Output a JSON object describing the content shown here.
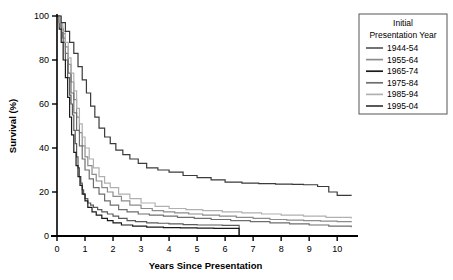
{
  "chart_data": {
    "type": "line",
    "title": "",
    "xlabel": "Years Since Presentation",
    "ylabel": "Survival (%)",
    "xlim": [
      0,
      10.6
    ],
    "ylim": [
      0,
      100
    ],
    "xticks": [
      "0",
      "1",
      "2",
      "3",
      "4",
      "5",
      "6",
      "7",
      "8",
      "9",
      "10"
    ],
    "xtick_values": [
      0,
      1,
      2,
      3,
      4,
      5,
      6,
      7,
      8,
      9,
      10
    ],
    "yticks": [
      "0",
      "20",
      "40",
      "60",
      "80",
      "100"
    ],
    "ytick_values": [
      0,
      20,
      40,
      60,
      80,
      100
    ],
    "grid": false,
    "step_style": "post",
    "legend": {
      "position": "top-right-outside",
      "title_line1": "Initial",
      "title_line2": "Presentation Year",
      "entries": [
        {
          "label": "1944-54",
          "color": "#5a5a5a"
        },
        {
          "label": "1955-64",
          "color": "#8c8c8c"
        },
        {
          "label": "1965-74",
          "color": "#1a1a1a"
        },
        {
          "label": "1975-84",
          "color": "#6e6e6e"
        },
        {
          "label": "1985-94",
          "color": "#b0b0b0"
        },
        {
          "label": "1995-04",
          "color": "#3a3a3a"
        }
      ]
    },
    "series": [
      {
        "name": "1944-54",
        "color": "#5a5a5a",
        "x": [
          0,
          0.08,
          0.15,
          0.22,
          0.3,
          0.38,
          0.45,
          0.5,
          0.55,
          0.6,
          0.65,
          0.7,
          0.75,
          0.8,
          0.85,
          0.9,
          0.95,
          1.0,
          1.1,
          1.2,
          1.3,
          1.45,
          1.6,
          1.8,
          2.0,
          2.2,
          2.5,
          2.8,
          3.2,
          3.6,
          4.0,
          4.5,
          5.0,
          5.5,
          5.9,
          6.4,
          6.5
        ],
        "y": [
          100,
          97,
          94,
          88,
          80,
          72,
          64,
          60,
          55,
          48,
          42,
          36,
          31,
          27,
          24,
          21,
          19,
          17,
          15,
          14,
          13,
          12,
          11,
          10,
          9,
          8,
          7,
          6.5,
          6,
          5.8,
          5.5,
          5.2,
          5,
          5,
          4.8,
          4.8,
          0
        ]
      },
      {
        "name": "1955-64",
        "color": "#8c8c8c",
        "x": [
          0,
          0.1,
          0.2,
          0.3,
          0.4,
          0.5,
          0.6,
          0.7,
          0.8,
          0.9,
          1.0,
          1.1,
          1.25,
          1.4,
          1.6,
          1.8,
          2.0,
          2.3,
          2.6,
          3.0,
          3.4,
          3.8,
          4.2,
          4.7,
          5.2,
          5.8,
          6.4,
          7.0,
          7.6,
          8.2,
          8.8,
          9.4,
          10.0,
          10.5
        ],
        "y": [
          100,
          96,
          92,
          86,
          78,
          70,
          62,
          54,
          47,
          41,
          36,
          32,
          28,
          25,
          22,
          20,
          18,
          16,
          14,
          12.5,
          11.5,
          11,
          10.5,
          10,
          9.5,
          9,
          8.5,
          8,
          7.5,
          7.2,
          7,
          6.8,
          6.5,
          6.3
        ]
      },
      {
        "name": "1965-74",
        "color": "#1a1a1a",
        "x": [
          0,
          0.08,
          0.15,
          0.22,
          0.3,
          0.38,
          0.45,
          0.52,
          0.6,
          0.68,
          0.75,
          0.82,
          0.9,
          1.0,
          1.1,
          1.25,
          1.4,
          1.6,
          1.8,
          2.0,
          2.3,
          2.7,
          3.2,
          3.8,
          4.4,
          5.0,
          5.6,
          6.2,
          6.5
        ],
        "y": [
          100,
          94,
          88,
          80,
          72,
          63,
          54,
          46,
          38,
          32,
          27,
          23,
          19,
          16,
          13,
          11,
          9.5,
          8,
          7,
          6,
          5,
          4.5,
          4,
          3.8,
          3.7,
          3.6,
          3.5,
          3.5,
          0.4
        ]
      },
      {
        "name": "1975-84",
        "color": "#6e6e6e",
        "x": [
          0,
          0.1,
          0.2,
          0.3,
          0.4,
          0.5,
          0.6,
          0.7,
          0.8,
          0.9,
          1.0,
          1.15,
          1.3,
          1.5,
          1.7,
          1.9,
          2.2,
          2.5,
          2.9,
          3.3,
          3.8,
          4.3,
          4.9,
          5.5,
          6.2,
          6.9,
          7.6,
          8.3,
          9.0,
          9.7,
          10.5
        ],
        "y": [
          100,
          95,
          90,
          83,
          74,
          65,
          56,
          48,
          41,
          35,
          30,
          26,
          22,
          19,
          16,
          14,
          12,
          11,
          10,
          9.5,
          9,
          8.5,
          8,
          7.5,
          7,
          6.5,
          6,
          5.5,
          5,
          4.5,
          4
        ]
      },
      {
        "name": "1985-94",
        "color": "#b0b0b0",
        "x": [
          0,
          0.1,
          0.2,
          0.3,
          0.4,
          0.5,
          0.6,
          0.7,
          0.8,
          0.9,
          1.0,
          1.15,
          1.3,
          1.5,
          1.7,
          1.9,
          2.2,
          2.6,
          3.0,
          3.5,
          4.0,
          4.6,
          5.2,
          5.9,
          6.6,
          7.3,
          8.0,
          8.8,
          9.6,
          10.5
        ],
        "y": [
          100,
          97,
          93,
          88,
          81,
          74,
          66,
          58,
          51,
          45,
          40,
          35,
          31,
          27,
          24,
          22,
          19,
          17,
          15,
          13.5,
          12.5,
          12,
          11.5,
          11,
          10.5,
          10,
          9.5,
          9,
          8.5,
          8
        ]
      },
      {
        "name": "1995-04",
        "color": "#3a3a3a",
        "x": [
          0,
          0.15,
          0.3,
          0.45,
          0.6,
          0.75,
          0.9,
          1.05,
          1.2,
          1.35,
          1.5,
          1.7,
          1.9,
          2.1,
          2.35,
          2.6,
          2.9,
          3.2,
          3.6,
          4.0,
          4.5,
          5.0,
          5.5,
          6.0,
          6.6,
          7.2,
          7.8,
          8.4,
          8.8,
          9.3,
          9.7,
          10.0,
          10.5
        ],
        "y": [
          100,
          97,
          93,
          88,
          83,
          77,
          71,
          65,
          59,
          54,
          49,
          45,
          42,
          39,
          37,
          35,
          33,
          31,
          30,
          29,
          27.5,
          26.5,
          25.5,
          24.5,
          24,
          23.8,
          23.6,
          23.5,
          23.3,
          22.5,
          20,
          18.5,
          18.3
        ]
      }
    ]
  }
}
